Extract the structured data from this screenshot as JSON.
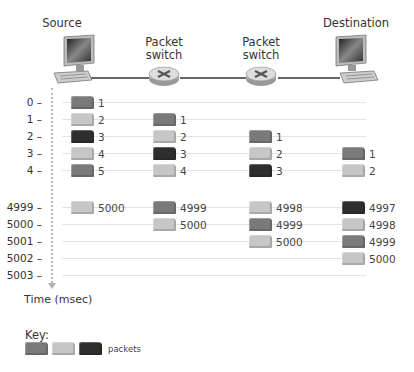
{
  "nodes": [
    {
      "id": "source",
      "label": "Source",
      "type": "computer",
      "x": 73
    },
    {
      "id": "switch1",
      "label": "Packet\nswitch",
      "line1": "Packet",
      "line2": "switch",
      "type": "router",
      "x": 164
    },
    {
      "id": "switch2",
      "label": "Packet\nswitch",
      "line1": "Packet",
      "line2": "switch",
      "type": "router",
      "x": 261
    },
    {
      "id": "destination",
      "label": "Destination",
      "type": "computer",
      "x": 355
    }
  ],
  "axis": {
    "label": "Time (msec)",
    "ticks": [
      "0",
      "1",
      "2",
      "3",
      "4",
      "4999",
      "5000",
      "5001",
      "5002",
      "5003"
    ],
    "tick_y": [
      102,
      119,
      136,
      153,
      170,
      207,
      224,
      241,
      258,
      275
    ]
  },
  "packet_colors": [
    "#7a7a7a",
    "#c6c6c6",
    "#2e2e2e"
  ],
  "columns": {
    "source": {
      "x": 71,
      "packets": [
        {
          "row": 0,
          "label": "1",
          "color": 0
        },
        {
          "row": 1,
          "label": "2",
          "color": 1
        },
        {
          "row": 2,
          "label": "3",
          "color": 2
        },
        {
          "row": 3,
          "label": "4",
          "color": 1
        },
        {
          "row": 4,
          "label": "5",
          "color": 0
        },
        {
          "row": 5,
          "label": "5000",
          "color": 1
        }
      ]
    },
    "switch1": {
      "x": 153,
      "packets": [
        {
          "row": 1,
          "label": "1",
          "color": 0
        },
        {
          "row": 2,
          "label": "2",
          "color": 1
        },
        {
          "row": 3,
          "label": "3",
          "color": 2
        },
        {
          "row": 4,
          "label": "4",
          "color": 1
        },
        {
          "row": 5,
          "label": "4999",
          "color": 0
        },
        {
          "row": 6,
          "label": "5000",
          "color": 1
        }
      ]
    },
    "switch2": {
      "x": 249,
      "packets": [
        {
          "row": 2,
          "label": "1",
          "color": 0
        },
        {
          "row": 3,
          "label": "2",
          "color": 1
        },
        {
          "row": 4,
          "label": "3",
          "color": 2
        },
        {
          "row": 5,
          "label": "4998",
          "color": 1
        },
        {
          "row": 6,
          "label": "4999",
          "color": 0
        },
        {
          "row": 7,
          "label": "5000",
          "color": 1
        }
      ]
    },
    "destination": {
      "x": 342,
      "packets": [
        {
          "row": 3,
          "label": "1",
          "color": 0
        },
        {
          "row": 4,
          "label": "2",
          "color": 1
        },
        {
          "row": 5,
          "label": "4997",
          "color": 2
        },
        {
          "row": 6,
          "label": "4998",
          "color": 1
        },
        {
          "row": 7,
          "label": "4999",
          "color": 0
        },
        {
          "row": 8,
          "label": "5000",
          "color": 1
        }
      ]
    }
  },
  "key": {
    "title": "Key:",
    "label": "packets",
    "swatches": [
      "#7a7a7a",
      "#c6c6c6",
      "#2e2e2e"
    ]
  }
}
